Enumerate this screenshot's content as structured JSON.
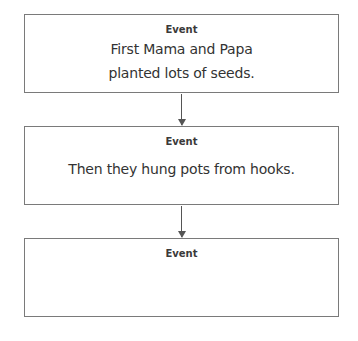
{
  "diagram": {
    "type": "sequence-flowchart",
    "boxes": [
      {
        "label": "Event",
        "lines": [
          "First Mama and Papa",
          "planted lots of seeds."
        ]
      },
      {
        "label": "Event",
        "lines": [
          "Then they hung pots from hooks."
        ]
      },
      {
        "label": "Event",
        "lines": []
      }
    ],
    "arrows": [
      {
        "from": 0,
        "to": 1
      },
      {
        "from": 1,
        "to": 2
      }
    ],
    "colors": {
      "border": "#7a7a7a",
      "arrow": "#555555",
      "text": "#333333"
    }
  }
}
